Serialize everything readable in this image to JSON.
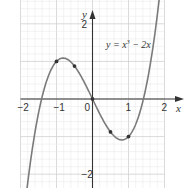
{
  "chart_data": {
    "type": "line",
    "title": "",
    "annotation": "y = x³ − 2x",
    "annotation_parts": {
      "prefix": "y = x",
      "sup": "3",
      "suffix": " − 2x"
    },
    "xlabel": "x",
    "ylabel": "y",
    "xlim": [
      -2,
      2
    ],
    "ylim": [
      -4,
      4
    ],
    "grid": true,
    "x_ticks": [
      {
        "value": -2,
        "label": "−2"
      },
      {
        "value": -1,
        "label": "−1"
      },
      {
        "value": 0,
        "label": "0"
      },
      {
        "value": 1,
        "label": "1"
      },
      {
        "value": 2,
        "label": "2"
      }
    ],
    "y_ticks": [
      {
        "value": 4,
        "label": "4"
      },
      {
        "value": 2,
        "label": "2"
      },
      {
        "value": -2,
        "label": "−2"
      },
      {
        "value": -4,
        "label": "−4"
      }
    ],
    "series": [
      {
        "name": "y = x³ − 2x",
        "function": "x^3 - 2x",
        "color": "#7a7a7a",
        "marked_points": [
          {
            "x": -2,
            "y": -4
          },
          {
            "x": -1,
            "y": 1
          },
          {
            "x": -0.5,
            "y": 0.875
          },
          {
            "x": 0,
            "y": 0
          },
          {
            "x": 0.5,
            "y": -0.875
          },
          {
            "x": 1,
            "y": -1
          },
          {
            "x": 2,
            "y": 4
          }
        ]
      }
    ]
  },
  "colors": {
    "grid_minor": "#e6e6e6",
    "grid_major": "#d0d0d0",
    "axis": "#333333",
    "curve": "#7a7a7a",
    "point": "#333333"
  }
}
